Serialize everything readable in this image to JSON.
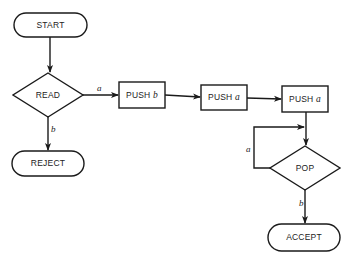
{
  "diagram": {
    "type": "flowchart",
    "nodes": {
      "start": {
        "label": "START",
        "shape": "terminal"
      },
      "read": {
        "label": "READ",
        "shape": "decision"
      },
      "reject": {
        "label": "REJECT",
        "shape": "terminal"
      },
      "push1": {
        "label": "PUSH",
        "var": "b",
        "shape": "process"
      },
      "push2": {
        "label": "PUSH",
        "var": "a",
        "shape": "process"
      },
      "push3": {
        "label": "PUSH",
        "var": "a",
        "shape": "process"
      },
      "pop": {
        "label": "POP",
        "shape": "decision"
      },
      "accept": {
        "label": "ACCEPT",
        "shape": "terminal"
      }
    },
    "edges": {
      "read_to_push1": {
        "from": "READ",
        "to": "PUSH b",
        "label": "a"
      },
      "read_to_reject": {
        "from": "READ",
        "to": "REJECT",
        "label": "b"
      },
      "pop_loop": {
        "from": "POP",
        "to": "POP",
        "label": "a"
      },
      "pop_to_accept": {
        "from": "POP",
        "to": "ACCEPT",
        "label": "b"
      }
    }
  }
}
